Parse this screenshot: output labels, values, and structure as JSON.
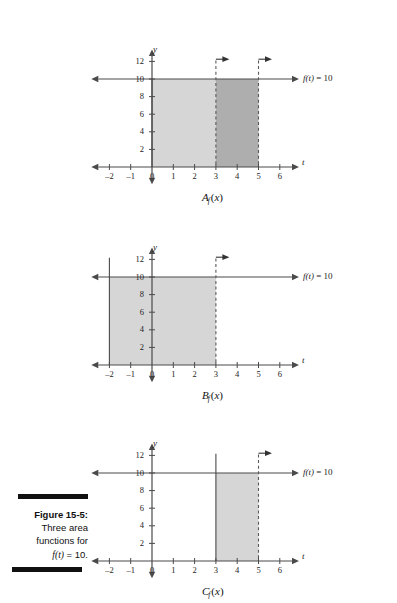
{
  "figure": {
    "caption_label": "Figure 15-5:",
    "caption_line2": "Three area",
    "caption_line3": "functions for",
    "caption_line4_fn": "f",
    "caption_line4_arg": "(t)",
    "caption_line4_rest": " = 10."
  },
  "common": {
    "x_axis_name": "t",
    "y_axis_name": "y",
    "function_label_f": "f",
    "function_label_arg": "(t)",
    "function_label_value": " = 10",
    "x_ticks": [
      "-2",
      "-1",
      "0",
      "1",
      "2",
      "3",
      "4",
      "5",
      "6"
    ],
    "x_tick_values": [
      -2,
      -1,
      0,
      1,
      2,
      3,
      4,
      5,
      6
    ],
    "y_ticks": [
      "2",
      "4",
      "6",
      "8",
      "10",
      "12"
    ],
    "y_tick_values": [
      2,
      4,
      6,
      8,
      10,
      12
    ],
    "colors": {
      "axis": "#4a4a4a",
      "fill_light": "#d6d6d6",
      "fill_dark": "#aeaeae",
      "text": "#1a1a1a",
      "caption_bar": "#111111"
    }
  },
  "panels": [
    {
      "id": "A",
      "caption_main": "A",
      "caption_sub": "f",
      "caption_tail": "(x)",
      "fn_label_f": "f",
      "fn_label_arg": "(t)",
      "fn_label_value": " = 10",
      "regions": [
        {
          "name": "region-light",
          "from": 0,
          "to": 3,
          "shade": "light"
        },
        {
          "name": "region-dark",
          "from": 3,
          "to": 5,
          "shade": "dark"
        }
      ],
      "solid_verticals": [
        0
      ],
      "dashed_verticals": [
        3,
        5
      ],
      "arrows_at": [
        3,
        5
      ]
    },
    {
      "id": "B",
      "caption_main": "B",
      "caption_sub": "f",
      "caption_tail": "(x)",
      "fn_label_f": "f",
      "fn_label_arg": "(t)",
      "fn_label_value": " = 10",
      "regions": [
        {
          "name": "region-light",
          "from": -2,
          "to": 3,
          "shade": "light"
        }
      ],
      "solid_verticals": [
        -2
      ],
      "dashed_verticals": [
        3
      ],
      "arrows_at": [
        3
      ]
    },
    {
      "id": "C",
      "caption_main": "C",
      "caption_sub": "f",
      "caption_tail": "(x)",
      "fn_label_f": "f",
      "fn_label_arg": "(t)",
      "fn_label_value": " = 10",
      "regions": [
        {
          "name": "region-light",
          "from": 3,
          "to": 5,
          "shade": "light"
        }
      ],
      "solid_verticals": [
        3
      ],
      "dashed_verticals": [
        5
      ],
      "arrows_at": [
        5
      ]
    }
  ],
  "chart_data": {
    "type": "area",
    "title": "Three area functions for f(t) = 10",
    "xlabel": "t",
    "ylabel": "y",
    "xlim": [
      -2.6,
      6.6
    ],
    "ylim": [
      -1.2,
      13
    ],
    "x_ticks": [
      -2,
      -1,
      0,
      1,
      2,
      3,
      4,
      5,
      6
    ],
    "y_ticks": [
      2,
      4,
      6,
      8,
      10,
      12
    ],
    "grid": false,
    "legend": "none",
    "series": [
      {
        "name": "f(t) = 10",
        "description": "constant horizontal line at y = 10 spanning the full t range",
        "x": [
          -2.6,
          6.6
        ],
        "values": [
          10,
          10
        ]
      }
    ],
    "panels": [
      {
        "name": "A_f(x)",
        "shaded_regions": [
          {
            "from": 0,
            "to": 3,
            "height": 10,
            "area": 30,
            "shade": "light"
          },
          {
            "from": 3,
            "to": 5,
            "height": 10,
            "area": 20,
            "shade": "dark"
          }
        ],
        "total_area": 50,
        "annotations": [
          "arrow at t = 3",
          "arrow at t = 5"
        ]
      },
      {
        "name": "B_f(x)",
        "shaded_regions": [
          {
            "from": -2,
            "to": 3,
            "height": 10,
            "area": 50,
            "shade": "light"
          }
        ],
        "total_area": 50,
        "annotations": [
          "arrow at t = 3"
        ]
      },
      {
        "name": "C_f(x)",
        "shaded_regions": [
          {
            "from": 3,
            "to": 5,
            "height": 10,
            "area": 20,
            "shade": "light"
          }
        ],
        "total_area": 20,
        "annotations": [
          "arrow at t = 5"
        ]
      }
    ]
  }
}
